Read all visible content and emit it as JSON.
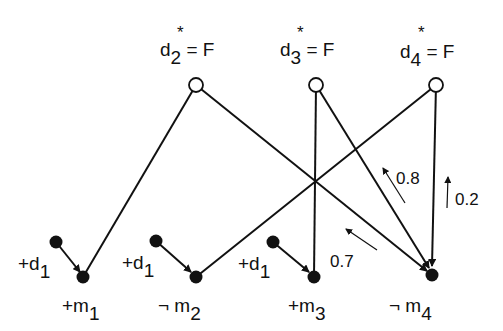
{
  "top_labels": [
    {
      "var": "d",
      "sub": "2",
      "star": "*",
      "eq": "= F"
    },
    {
      "var": "d",
      "sub": "3",
      "star": "*",
      "eq": "= F"
    },
    {
      "var": "d",
      "sub": "4",
      "star": "*",
      "eq": "= F"
    }
  ],
  "cause_labels": [
    {
      "sign": "+d",
      "sub": "1"
    },
    {
      "sign": "+d",
      "sub": "1"
    },
    {
      "sign": "+d",
      "sub": "1"
    }
  ],
  "bottom_labels": [
    {
      "prefix": "+m",
      "sub": "1"
    },
    {
      "prefix": "¬ m",
      "sub": "2"
    },
    {
      "prefix": "+m",
      "sub": "3"
    },
    {
      "prefix": "¬ m",
      "sub": "4"
    }
  ],
  "weights": {
    "w1": "0.8",
    "w2": "0.2",
    "w3": "0.7"
  },
  "colors": {
    "ink": "#111111",
    "background": "#ffffff"
  }
}
